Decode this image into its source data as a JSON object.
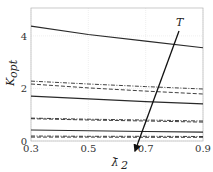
{
  "chart_data": {
    "type": "line",
    "title": "",
    "xlabel": "λ̄2",
    "ylabel": "K_opt",
    "xlim": [
      0.3,
      0.9
    ],
    "ylim": [
      0,
      5
    ],
    "xticks": [
      "0.3",
      "0.5",
      "0.7",
      "0.9"
    ],
    "yticks": [
      "0",
      "2",
      "4"
    ],
    "grid": true,
    "x": [
      0.3,
      0.5,
      0.7,
      0.9
    ],
    "series": [
      {
        "name": "solid-1",
        "style": "solid",
        "values": [
          4.37,
          4.05,
          3.8,
          3.55
        ]
      },
      {
        "name": "dashdot-1",
        "style": "dashdot",
        "values": [
          2.28,
          2.17,
          2.07,
          1.98
        ]
      },
      {
        "name": "dashed-1",
        "style": "dashed",
        "values": [
          2.17,
          2.02,
          1.9,
          1.79
        ]
      },
      {
        "name": "solid-2",
        "style": "solid",
        "values": [
          1.71,
          1.6,
          1.5,
          1.41
        ]
      },
      {
        "name": "dashdot-2",
        "style": "dashdot",
        "values": [
          0.87,
          0.83,
          0.8,
          0.76
        ]
      },
      {
        "name": "dashed-2",
        "style": "dashed",
        "values": [
          0.85,
          0.8,
          0.76,
          0.72
        ]
      },
      {
        "name": "solid-3",
        "style": "solid",
        "values": [
          0.42,
          0.39,
          0.36,
          0.34
        ]
      },
      {
        "name": "dashdot-3",
        "style": "dashdot",
        "values": [
          0.19,
          0.18,
          0.18,
          0.17
        ]
      },
      {
        "name": "dashed-3",
        "style": "dashed",
        "values": [
          0.15,
          0.15,
          0.14,
          0.14
        ]
      }
    ],
    "annotations": [
      {
        "type": "arrow",
        "label": "T",
        "from": [
          0.8,
          4.2
        ],
        "to": [
          0.67,
          -0.4
        ],
        "note": "increasing T direction"
      }
    ]
  },
  "axes": {
    "xlabel_text": "λ̄",
    "xlabel_sub": "2",
    "ylabel_text": "K",
    "ylabel_sub": "opt",
    "arrow_label": "T"
  }
}
